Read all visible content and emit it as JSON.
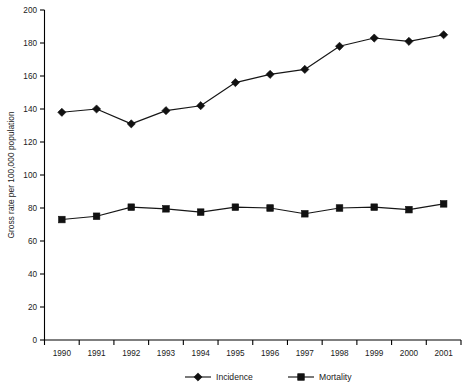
{
  "chart_data": {
    "type": "line",
    "title": "",
    "xlabel": "",
    "ylabel": "Gross rate per 100,000 population",
    "categories": [
      "1990",
      "1991",
      "1992",
      "1993",
      "1994",
      "1995",
      "1996",
      "1997",
      "1998",
      "1999",
      "2000",
      "2001"
    ],
    "x": [
      1990,
      1991,
      1992,
      1993,
      1994,
      1995,
      1996,
      1997,
      1998,
      1999,
      2000,
      2001
    ],
    "ylim": [
      0,
      200
    ],
    "yticks": [
      0,
      20,
      40,
      60,
      80,
      100,
      120,
      140,
      160,
      180,
      200
    ],
    "ytick_labels": [
      "0",
      "20",
      "40",
      "60",
      "80",
      "100",
      "120",
      "140",
      "160",
      "180",
      "200"
    ],
    "grid": false,
    "legend_position": "bottom-center",
    "series": [
      {
        "name": "Incidence",
        "marker": "diamond",
        "color": "#111111",
        "values": [
          138,
          140,
          131,
          139,
          142,
          156,
          161,
          164,
          178,
          183,
          181,
          185
        ]
      },
      {
        "name": "Mortality",
        "marker": "square",
        "color": "#111111",
        "values": [
          73,
          75,
          80.5,
          79.5,
          77.5,
          80.5,
          80,
          76.5,
          80,
          80.5,
          79,
          82.5
        ]
      }
    ]
  },
  "legend": {
    "items": [
      {
        "label": "Incidence",
        "marker": "diamond"
      },
      {
        "label": "Mortality",
        "marker": "square"
      }
    ]
  }
}
